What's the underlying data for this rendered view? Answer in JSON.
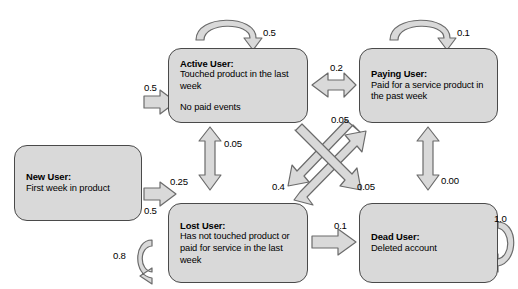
{
  "diagram": {
    "type": "state-transition-diagram",
    "canvas": {
      "width": 518,
      "height": 289,
      "background": "#ffffff"
    },
    "style": {
      "node_fill": "#d9d9d9",
      "node_border": "#4a4a4a",
      "arrow_fill": "#d9d9d9",
      "arrow_border": "#6b6b6b",
      "text_color": "#000000"
    },
    "nodes": [
      {
        "id": "new-user",
        "title": "New User:",
        "desc": "First week in product",
        "extra": "",
        "x": 14,
        "y": 145,
        "w": 128,
        "h": 76
      },
      {
        "id": "active-user",
        "title": "Active User:",
        "desc": "Touched product in the last week",
        "extra": "No paid events",
        "x": 168,
        "y": 48,
        "w": 140,
        "h": 75
      },
      {
        "id": "paying-user",
        "title": "Paying User:",
        "desc": "Paid for a service product in the past week",
        "extra": "",
        "x": 359,
        "y": 48,
        "w": 139,
        "h": 75
      },
      {
        "id": "lost-user",
        "title": "Lost User:",
        "desc": "Has not touched product or paid for service in the last week",
        "extra": "",
        "x": 168,
        "y": 203,
        "w": 140,
        "h": 80
      },
      {
        "id": "dead-user",
        "title": "Dead User:",
        "desc": "Deleted account",
        "extra": "",
        "x": 359,
        "y": 203,
        "w": 139,
        "h": 80
      }
    ],
    "edges": [
      {
        "id": "new-to-active",
        "from": "new-user",
        "to": "active-user",
        "label": "0.5",
        "kind": "block-arrow",
        "direction": "right"
      },
      {
        "id": "new-to-lost",
        "from": "new-user",
        "to": "lost-user",
        "label": "0.5",
        "kind": "block-arrow",
        "direction": "right"
      },
      {
        "id": "active-self",
        "from": "active-user",
        "to": "active-user",
        "label": "0.5",
        "kind": "self-loop",
        "direction": "top"
      },
      {
        "id": "paying-self",
        "from": "paying-user",
        "to": "paying-user",
        "label": "0.1",
        "kind": "self-loop",
        "direction": "top"
      },
      {
        "id": "lost-self",
        "from": "lost-user",
        "to": "lost-user",
        "label": "0.8",
        "kind": "self-loop",
        "direction": "left"
      },
      {
        "id": "dead-self",
        "from": "dead-user",
        "to": "dead-user",
        "label": "1.0",
        "kind": "self-loop",
        "direction": "right"
      },
      {
        "id": "active-paying",
        "from": "active-user",
        "to": "paying-user",
        "label": "0.2",
        "kind": "double-arrow",
        "direction": "horizontal"
      },
      {
        "id": "active-lost-up",
        "from": "lost-user",
        "to": "active-user",
        "label": "0.05",
        "kind": "double-arrow",
        "direction": "vertical"
      },
      {
        "id": "active-lost-down",
        "from": "active-user",
        "to": "lost-user",
        "label": "0.25",
        "kind": "double-arrow",
        "direction": "vertical"
      },
      {
        "id": "paying-dead",
        "from": "paying-user",
        "to": "dead-user",
        "label": "0.00",
        "kind": "double-arrow",
        "direction": "vertical"
      },
      {
        "id": "lost-to-paying",
        "from": "lost-user",
        "to": "paying-user",
        "label": "0.05",
        "kind": "block-arrow",
        "direction": "diagonal-up-right"
      },
      {
        "id": "active-to-dead",
        "from": "active-user",
        "to": "dead-user",
        "label": "0.05",
        "kind": "block-arrow",
        "direction": "diagonal-down-right"
      },
      {
        "id": "paying-to-lost",
        "from": "paying-user",
        "to": "lost-user",
        "label": "0.4",
        "kind": "block-arrow",
        "direction": "diagonal-down-left"
      },
      {
        "id": "lost-to-dead",
        "from": "lost-user",
        "to": "dead-user",
        "label": "0.1",
        "kind": "block-arrow",
        "direction": "right"
      }
    ],
    "labels": {
      "new_to_active": "0.5",
      "new_to_lost": "0.5",
      "active_self": "0.5",
      "paying_self": "0.1",
      "lost_self": "0.8",
      "dead_self": "1.0",
      "active_paying": "0.2",
      "lost_to_active": "0.05",
      "active_to_lost": "0.25",
      "paying_dead": "0.00",
      "lost_to_paying": "0.05",
      "active_to_dead": "0.05",
      "paying_to_lost": "0.4",
      "lost_to_dead": "0.1"
    }
  }
}
